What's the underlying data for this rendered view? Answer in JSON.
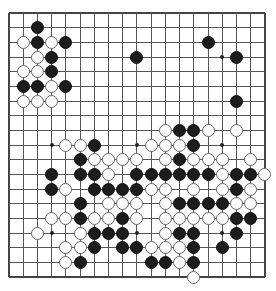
{
  "board": {
    "size": 19,
    "origin_x": 9,
    "origin_y": 13,
    "spacing_x": 14.22,
    "spacing_y": 14.67,
    "colors": {
      "black": "#1c1c1c",
      "white": "#ffffff",
      "line": "#555555",
      "background": "#ffffff"
    },
    "hoshi": [
      [
        15,
        3
      ],
      [
        3,
        9
      ],
      [
        9,
        9
      ],
      [
        15,
        9
      ],
      [
        3,
        15
      ],
      [
        9,
        15
      ],
      [
        15,
        15
      ],
      [
        3,
        3
      ],
      [
        9,
        3
      ]
    ],
    "stones": {
      "black": [
        [
          2,
          1
        ],
        [
          2,
          2
        ],
        [
          4,
          2
        ],
        [
          3,
          3
        ],
        [
          3,
          4
        ],
        [
          1,
          5
        ],
        [
          2,
          5
        ],
        [
          4,
          5
        ],
        [
          14,
          2
        ],
        [
          9,
          3
        ],
        [
          16,
          3
        ],
        [
          16,
          6
        ],
        [
          12,
          8
        ],
        [
          13,
          8
        ],
        [
          6,
          9
        ],
        [
          13,
          9
        ],
        [
          5,
          10
        ],
        [
          12,
          10
        ],
        [
          3,
          11
        ],
        [
          5,
          11
        ],
        [
          6,
          11
        ],
        [
          9,
          11
        ],
        [
          10,
          11
        ],
        [
          11,
          11
        ],
        [
          12,
          11
        ],
        [
          13,
          11
        ],
        [
          14,
          11
        ],
        [
          16,
          11
        ],
        [
          17,
          11
        ],
        [
          3,
          12
        ],
        [
          6,
          12
        ],
        [
          7,
          12
        ],
        [
          8,
          12
        ],
        [
          9,
          12
        ],
        [
          16,
          12
        ],
        [
          5,
          13
        ],
        [
          12,
          13
        ],
        [
          13,
          13
        ],
        [
          14,
          13
        ],
        [
          15,
          13
        ],
        [
          5,
          14
        ],
        [
          8,
          14
        ],
        [
          16,
          14
        ],
        [
          17,
          14
        ],
        [
          6,
          15
        ],
        [
          7,
          15
        ],
        [
          8,
          15
        ],
        [
          12,
          15
        ],
        [
          13,
          15
        ],
        [
          16,
          15
        ],
        [
          6,
          16
        ],
        [
          8,
          16
        ],
        [
          9,
          16
        ],
        [
          13,
          16
        ],
        [
          15,
          16
        ],
        [
          5,
          17
        ],
        [
          10,
          17
        ],
        [
          11,
          17
        ],
        [
          13,
          17
        ]
      ],
      "white": [
        [
          1,
          2
        ],
        [
          3,
          2
        ],
        [
          2,
          3
        ],
        [
          1,
          4
        ],
        [
          2,
          4
        ],
        [
          3,
          5
        ],
        [
          1,
          6
        ],
        [
          2,
          6
        ],
        [
          3,
          6
        ],
        [
          11,
          8
        ],
        [
          14,
          8
        ],
        [
          16,
          8
        ],
        [
          4,
          9
        ],
        [
          5,
          9
        ],
        [
          10,
          9
        ],
        [
          11,
          9
        ],
        [
          12,
          9
        ],
        [
          6,
          10
        ],
        [
          7,
          10
        ],
        [
          8,
          10
        ],
        [
          9,
          10
        ],
        [
          11,
          10
        ],
        [
          13,
          10
        ],
        [
          14,
          10
        ],
        [
          15,
          10
        ],
        [
          17,
          10
        ],
        [
          7,
          11
        ],
        [
          15,
          11
        ],
        [
          18,
          11
        ],
        [
          4,
          12
        ],
        [
          10,
          12
        ],
        [
          11,
          12
        ],
        [
          13,
          12
        ],
        [
          15,
          12
        ],
        [
          17,
          12
        ],
        [
          7,
          13
        ],
        [
          8,
          13
        ],
        [
          9,
          13
        ],
        [
          11,
          13
        ],
        [
          16,
          13
        ],
        [
          17,
          13
        ],
        [
          3,
          14
        ],
        [
          4,
          14
        ],
        [
          6,
          14
        ],
        [
          7,
          14
        ],
        [
          9,
          14
        ],
        [
          11,
          14
        ],
        [
          12,
          14
        ],
        [
          13,
          14
        ],
        [
          14,
          14
        ],
        [
          15,
          14
        ],
        [
          2,
          15
        ],
        [
          5,
          15
        ],
        [
          11,
          15
        ],
        [
          4,
          16
        ],
        [
          5,
          16
        ],
        [
          10,
          16
        ],
        [
          11,
          16
        ],
        [
          12,
          16
        ],
        [
          4,
          17
        ],
        [
          12,
          17
        ],
        [
          13,
          18
        ]
      ]
    }
  }
}
